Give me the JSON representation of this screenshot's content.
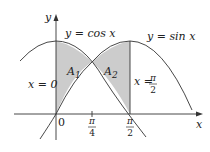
{
  "figure": {
    "curves": [
      {
        "name": "cosine",
        "label": "y = cos x"
      },
      {
        "name": "sine",
        "label": "y = sin x"
      }
    ],
    "regions": [
      {
        "name": "A1",
        "label": "A",
        "subscript": "1"
      },
      {
        "name": "A2",
        "label": "A",
        "subscript": "2"
      }
    ],
    "boundaries": {
      "left": "x = 0",
      "right_prefix": "x =",
      "right_num": "π",
      "right_den": "2"
    },
    "axes": {
      "x_label": "x",
      "y_label": "y",
      "origin_label": "0"
    },
    "ticks": [
      {
        "num": "π",
        "den": "4"
      },
      {
        "num": "π",
        "den": "2"
      }
    ],
    "colors": {
      "curve": "#333333",
      "fill": "#cccccc",
      "axis": "#333333"
    }
  }
}
